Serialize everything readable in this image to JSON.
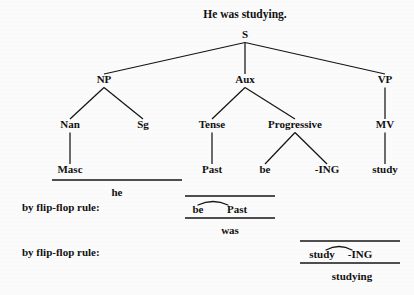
{
  "title": "He was studying.",
  "tree": {
    "nodes": [
      {
        "id": "S",
        "label": "S",
        "x": 245,
        "y": 38
      },
      {
        "id": "NP",
        "label": "NP",
        "x": 104,
        "y": 83
      },
      {
        "id": "Aux",
        "label": "Aux",
        "x": 245,
        "y": 83
      },
      {
        "id": "VP",
        "label": "VP",
        "x": 385,
        "y": 83
      },
      {
        "id": "Nan",
        "label": "Nan",
        "x": 70,
        "y": 128
      },
      {
        "id": "Sg",
        "label": "Sg",
        "x": 143,
        "y": 128
      },
      {
        "id": "Tense",
        "label": "Tense",
        "x": 212,
        "y": 128
      },
      {
        "id": "Progressive",
        "label": "Progressive",
        "x": 295,
        "y": 128
      },
      {
        "id": "MV",
        "label": "MV",
        "x": 385,
        "y": 128
      },
      {
        "id": "Masc",
        "label": "Masc",
        "x": 70,
        "y": 173
      },
      {
        "id": "Past",
        "label": "Past",
        "x": 212,
        "y": 173
      },
      {
        "id": "be",
        "label": "be",
        "x": 265,
        "y": 173
      },
      {
        "id": "ING",
        "label": "-ING",
        "x": 327,
        "y": 173
      },
      {
        "id": "study",
        "label": "study",
        "x": 385,
        "y": 173
      }
    ],
    "edges": [
      {
        "from": "S",
        "to": "NP"
      },
      {
        "from": "S",
        "to": "Aux"
      },
      {
        "from": "S",
        "to": "VP"
      },
      {
        "from": "NP",
        "to": "Nan"
      },
      {
        "from": "NP",
        "to": "Sg"
      },
      {
        "from": "Aux",
        "to": "Tense"
      },
      {
        "from": "Aux",
        "to": "Progressive"
      },
      {
        "from": "VP",
        "to": "MV"
      },
      {
        "from": "Nan",
        "to": "Masc"
      },
      {
        "from": "Tense",
        "to": "Past"
      },
      {
        "from": "Progressive",
        "to": "be"
      },
      {
        "from": "Progressive",
        "to": "ING"
      },
      {
        "from": "MV",
        "to": "study"
      }
    ]
  },
  "derivations": [
    {
      "id": "he",
      "label": "",
      "top_rule": {
        "x1": 52,
        "x2": 182,
        "y": 180
      },
      "result": {
        "text": "he",
        "x": 117,
        "y": 196
      }
    },
    {
      "id": "was",
      "label": "by flip-flop rule:",
      "label_x": 22,
      "label_y": 211,
      "top_rule": {
        "x1": 185,
        "x2": 275,
        "y": 196
      },
      "bottom_rule": {
        "x1": 185,
        "x2": 275,
        "y": 218
      },
      "tie": {
        "x1": 198,
        "x2": 228,
        "y": 205,
        "lift": 7
      },
      "terms": [
        {
          "text": "be",
          "x": 198,
          "y": 213
        },
        {
          "text": "Past",
          "x": 237,
          "y": 213
        }
      ],
      "result": {
        "text": "was",
        "x": 230,
        "y": 234
      }
    },
    {
      "id": "studying",
      "label": "by flip-flop rule:",
      "label_x": 22,
      "label_y": 256,
      "top_rule": {
        "x1": 300,
        "x2": 400,
        "y": 241
      },
      "bottom_rule": {
        "x1": 300,
        "x2": 400,
        "y": 263
      },
      "tie": {
        "x1": 326,
        "x2": 352,
        "y": 250,
        "lift": 7
      },
      "terms": [
        {
          "text": "study",
          "x": 322,
          "y": 258
        },
        {
          "text": "-ING",
          "x": 360,
          "y": 258
        }
      ],
      "result": {
        "text": "studying",
        "x": 352,
        "y": 280
      }
    }
  ],
  "colors": {
    "ink": "#141414",
    "background": "#fbfbfb"
  }
}
